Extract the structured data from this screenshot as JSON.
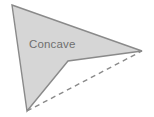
{
  "figure": {
    "type": "geometry-diagram",
    "label": "Concave",
    "background_color": "#ffffff",
    "polygon": {
      "name": "concave-quadrilateral",
      "fill_color": "#d6d6d6",
      "stroke_color": "#8a8a8a",
      "stroke_width": 1.4,
      "points": "12,5 142,51 68,61 27,111",
      "vertices": [
        {
          "name": "top-left-apex",
          "x": 12,
          "y": 5
        },
        {
          "name": "right-point",
          "x": 142,
          "y": 51
        },
        {
          "name": "reflex-vertex",
          "x": 68,
          "y": 61
        },
        {
          "name": "bottom-vertex",
          "x": 27,
          "y": 111
        }
      ]
    },
    "dashed_edge": {
      "name": "hull-closing-edge",
      "stroke_color": "#8a8a8a",
      "stroke_width": 1.4,
      "dash_pattern": "5 4",
      "x1": 27,
      "y1": 111,
      "x2": 142,
      "y2": 51
    },
    "label_position": {
      "x": 29,
      "y": 37
    },
    "label_color": "#6f6f6f"
  }
}
